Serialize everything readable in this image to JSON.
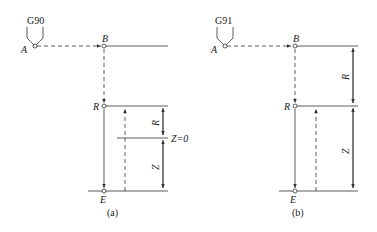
{
  "figure_a": {
    "mode_label": "G90",
    "point_a": "A",
    "point_b": "B",
    "point_r": "R",
    "point_e": "E",
    "dim_r": "R",
    "dim_z": "Z",
    "zero_label": "Z=0",
    "caption": "(a)"
  },
  "figure_b": {
    "mode_label": "G91",
    "point_a": "A",
    "point_b": "B",
    "point_r": "R",
    "point_e": "E",
    "dim_r": "R",
    "dim_z": "Z",
    "caption": "(b)"
  },
  "colors": {
    "line": "#333333",
    "background": "#ffffff"
  }
}
